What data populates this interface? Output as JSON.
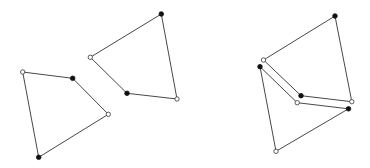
{
  "diagram": {
    "width": 370,
    "height": 168,
    "background": "#ffffff",
    "stroke_color": "#333333",
    "filled_color": "#111111",
    "open_fill": "#ffffff",
    "panels": [
      {
        "name": "separated",
        "quads": [
          {
            "name": "left-quad",
            "vertices": [
              {
                "x": 22.7,
                "y": 72.0,
                "type": "open"
              },
              {
                "x": 72.7,
                "y": 78.3,
                "type": "filled"
              },
              {
                "x": 108.3,
                "y": 114.3,
                "type": "open"
              },
              {
                "x": 38.7,
                "y": 157.3,
                "type": "filled"
              }
            ]
          },
          {
            "name": "right-quad",
            "vertices": [
              {
                "x": 161.3,
                "y": 14.0,
                "type": "filled"
              },
              {
                "x": 90.3,
                "y": 57.3,
                "type": "open"
              },
              {
                "x": 127.0,
                "y": 93.3,
                "type": "filled"
              },
              {
                "x": 177.0,
                "y": 99.0,
                "type": "open"
              }
            ]
          }
        ]
      },
      {
        "name": "joined",
        "quads": [
          {
            "name": "upper-quad",
            "vertices": [
              {
                "x": 335.0,
                "y": 16.0,
                "type": "filled"
              },
              {
                "x": 263.5,
                "y": 60.0,
                "type": "open"
              },
              {
                "x": 301.0,
                "y": 95.7,
                "type": "filled"
              },
              {
                "x": 351.8,
                "y": 101.7,
                "type": "open"
              }
            ]
          },
          {
            "name": "lower-quad",
            "vertices": [
              {
                "x": 260.0,
                "y": 66.7,
                "type": "filled"
              },
              {
                "x": 297.2,
                "y": 102.7,
                "type": "open"
              },
              {
                "x": 348.5,
                "y": 108.8,
                "type": "filled"
              },
              {
                "x": 276.0,
                "y": 151.3,
                "type": "open"
              }
            ]
          }
        ]
      }
    ]
  }
}
